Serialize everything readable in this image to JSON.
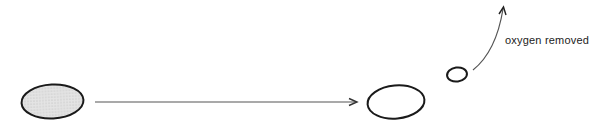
{
  "diagram": {
    "annotation": "oxygen removed",
    "colors": {
      "stroke": "#1a1a1a",
      "fill_shaded": "#d9d9d9",
      "line": "#444444",
      "background": "#ffffff"
    },
    "nodes": [
      {
        "id": "start-molecule",
        "shape": "ellipse",
        "shaded": true
      },
      {
        "id": "end-molecule",
        "shape": "ellipse",
        "shaded": false
      },
      {
        "id": "oxygen",
        "shape": "ellipse",
        "shaded": false
      }
    ],
    "edges": [
      {
        "from": "start-molecule",
        "to": "end-molecule",
        "style": "straight-arrow"
      },
      {
        "from": "oxygen",
        "to": "out",
        "style": "curved-arrow",
        "label": "oxygen removed"
      }
    ]
  }
}
